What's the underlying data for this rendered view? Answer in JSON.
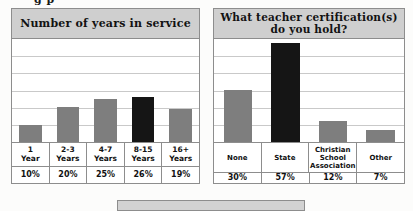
{
  "page": {
    "background_color": "#fbfbfa",
    "top_cut_text": "g p",
    "bottom_panel": {
      "name": "cut-off-gray-panel",
      "color": "#d2d2d2"
    }
  },
  "colors": {
    "header_band": "#cfcfcf",
    "bar_gray": "#7e7e7e",
    "bar_dark": "#151515",
    "border": "#8d8d8d",
    "gridline": "#c9c9c9",
    "plot_background": "#ffffff"
  },
  "chart_data": [
    {
      "id": "years-in-service",
      "type": "bar",
      "title": "Number of years in service",
      "xlabel": "",
      "ylabel": "",
      "ylim": [
        0,
        60
      ],
      "grid": true,
      "gridlines": [
        10,
        20,
        30,
        40,
        50
      ],
      "legend": "none",
      "categories": [
        "1\nYear",
        "2-3\nYears",
        "4-7\nYears",
        "8-15\nYears",
        "16+\nYears"
      ],
      "value_labels": [
        "10%",
        "20%",
        "25%",
        "26%",
        "19%"
      ],
      "values": [
        10,
        20,
        25,
        26,
        19
      ],
      "highlight_index": 3
    },
    {
      "id": "teacher-certifications",
      "type": "bar",
      "title": "What teacher certification(s)\ndo you hold?",
      "xlabel": "",
      "ylabel": "",
      "ylim": [
        0,
        60
      ],
      "grid": true,
      "gridlines": [
        10,
        20,
        30,
        40,
        50
      ],
      "legend": "none",
      "categories": [
        "None",
        "State",
        "Christian\nSchool\nAssociation",
        "Other"
      ],
      "value_labels": [
        "30%",
        "57%",
        "12%",
        "7%"
      ],
      "values": [
        30,
        57,
        12,
        7
      ],
      "highlight_index": 1
    }
  ]
}
